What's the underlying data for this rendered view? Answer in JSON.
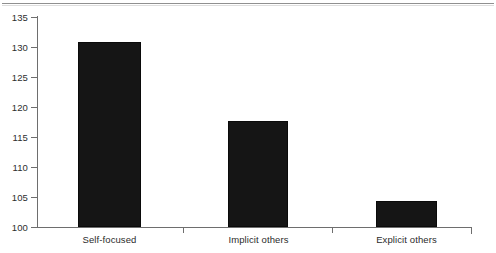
{
  "chart_data": {
    "type": "bar",
    "title": "",
    "subtitle": "",
    "xlabel": "",
    "ylabel": "",
    "categories": [
      "Self-focused",
      "Implicit others",
      "Explicit others"
    ],
    "values": [
      130.9,
      117.6,
      104.4
    ],
    "series": [
      {
        "name": "",
        "values": [
          130.9,
          117.6,
          104.4
        ]
      }
    ],
    "ylim": [
      100,
      135
    ],
    "ytick_labels": [
      "100",
      "105",
      "110",
      "115",
      "120",
      "125",
      "130",
      "135"
    ],
    "ytick_values": [
      100,
      105,
      110,
      115,
      120,
      125,
      130,
      135
    ],
    "grid": false,
    "legend": false,
    "legend_position": "none",
    "bar_color": "#151515",
    "axis_color": "#6e6e6e",
    "annotations": []
  },
  "figure": {
    "background": "#ffffff",
    "page_rule": true
  }
}
